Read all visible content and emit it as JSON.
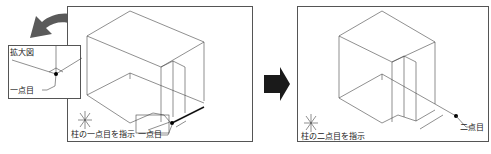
{
  "left_panel": {
    "prompt": "柱の一点目を指示",
    "callout": "一点目",
    "inset": {
      "title": "拡大図",
      "callout": "一点目"
    }
  },
  "right_panel": {
    "prompt": "柱の二点目を指示",
    "callout": "二点目"
  },
  "arrow": {
    "direction": "right",
    "color": "#1a1a1a"
  },
  "curved_arrow": {
    "color": "#555555"
  }
}
